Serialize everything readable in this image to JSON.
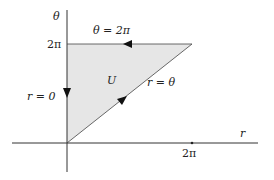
{
  "diagram": {
    "type": "region-diagram",
    "axes": {
      "horizontal_label": "r",
      "vertical_label": "θ",
      "horizontal_tick": "2π",
      "vertical_tick": "2π"
    },
    "region": {
      "label": "U",
      "fill": "#e6e6e6",
      "vertices": [
        [
          0,
          0
        ],
        [
          0,
          "2π"
        ],
        [
          "2π",
          "2π"
        ]
      ]
    },
    "edges": {
      "top": "θ = 2π",
      "left": "r = 0",
      "diagonal": "r = θ"
    },
    "colors": {
      "stroke": "#333333",
      "fill": "#e6e6e6"
    }
  }
}
